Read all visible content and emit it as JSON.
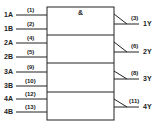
{
  "diagram": {
    "type": "logic-symbol",
    "function_symbol": "&",
    "gates": [
      {
        "inputs": [
          {
            "name": "1A",
            "pin": "(1)"
          },
          {
            "name": "1B",
            "pin": "(2)"
          }
        ],
        "output": {
          "name": "1Y",
          "pin": "(3)"
        }
      },
      {
        "inputs": [
          {
            "name": "2A",
            "pin": "(4)"
          },
          {
            "name": "2B",
            "pin": "(5)"
          }
        ],
        "output": {
          "name": "2Y",
          "pin": "(6)"
        }
      },
      {
        "inputs": [
          {
            "name": "3A",
            "pin": "(9)"
          },
          {
            "name": "3B",
            "pin": "(10)"
          }
        ],
        "output": {
          "name": "3Y",
          "pin": "(8)"
        }
      },
      {
        "inputs": [
          {
            "name": "4A",
            "pin": "(12)"
          },
          {
            "name": "4B",
            "pin": "(13)"
          }
        ],
        "output": {
          "name": "4Y",
          "pin": "(11)"
        }
      }
    ]
  }
}
